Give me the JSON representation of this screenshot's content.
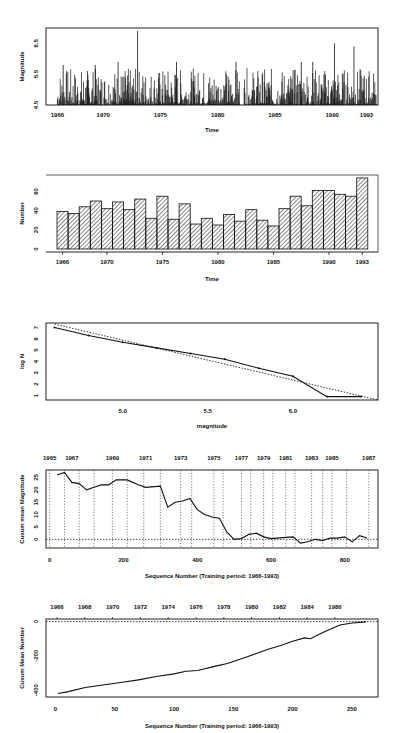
{
  "chart_data": [
    {
      "type": "bar",
      "subtype": "spike-time-series",
      "title": "",
      "xlabel": "Time",
      "ylabel": "Magnitude",
      "xticks": [
        "1966",
        "1970",
        "1975",
        "1980",
        "1985",
        "1990",
        "1993"
      ],
      "xtick_values": [
        1966,
        1970,
        1975,
        1980,
        1985,
        1990,
        1993
      ],
      "yticks": [
        "4.5",
        "5.5",
        "6.5"
      ],
      "ylim": [
        4.5,
        7.0
      ],
      "xlim": [
        1965.0,
        1994.0
      ],
      "description": "Dense vertical spikes per event, most between 4.5 and 5.5; largest spike ~6.9 near 1973",
      "notable_peaks": [
        {
          "x": 1966.5,
          "y": 5.8
        },
        {
          "x": 1969.3,
          "y": 5.8
        },
        {
          "x": 1971.3,
          "y": 5.9
        },
        {
          "x": 1973.0,
          "y": 6.9
        },
        {
          "x": 1976.4,
          "y": 5.9
        },
        {
          "x": 1981.6,
          "y": 5.9
        },
        {
          "x": 1987.3,
          "y": 5.9
        },
        {
          "x": 1988.3,
          "y": 5.9
        },
        {
          "x": 1990.2,
          "y": 6.5
        },
        {
          "x": 1991.9,
          "y": 6.4
        }
      ],
      "grid": false
    },
    {
      "type": "bar",
      "title": "",
      "xlabel": "Time",
      "ylabel": "Number",
      "categories": [
        "1966",
        "1967",
        "1968",
        "1969",
        "1970",
        "1971",
        "1972",
        "1973",
        "1974",
        "1975",
        "1976",
        "1977",
        "1978",
        "1979",
        "1980",
        "1981",
        "1982",
        "1983",
        "1984",
        "1985",
        "1986",
        "1987",
        "1988",
        "1989",
        "1990",
        "1991",
        "1992",
        "1993"
      ],
      "values": [
        39,
        37,
        44,
        50,
        42,
        49,
        41,
        52,
        32,
        55,
        31,
        47,
        26,
        32,
        25,
        36,
        29,
        41,
        30,
        24,
        42,
        55,
        45,
        61,
        61,
        57,
        55,
        74
      ],
      "xticks": [
        "1966",
        "1970",
        "1975",
        "1980",
        "1985",
        "1990",
        "1993"
      ],
      "yticks": [
        "0",
        "20",
        "40",
        "60"
      ],
      "ylim": [
        0,
        75
      ],
      "pattern": "diagonal-hatch",
      "grid": false
    },
    {
      "type": "line",
      "title": "",
      "xlabel": "magnitude",
      "ylabel": "log N",
      "xticks": [
        "5.0",
        "5.5",
        "6.0"
      ],
      "yticks": [
        "1",
        "2",
        "3",
        "4",
        "5",
        "6",
        "7"
      ],
      "xlim": [
        4.55,
        6.5
      ],
      "ylim": [
        0.6,
        7.4
      ],
      "series": [
        {
          "name": "observed",
          "style": "solid-with-markers",
          "x": [
            4.6,
            4.8,
            5.0,
            5.2,
            5.4,
            5.6,
            5.8,
            6.0,
            6.2,
            6.4
          ],
          "y": [
            7.0,
            6.3,
            5.7,
            5.2,
            4.7,
            4.2,
            3.4,
            2.7,
            0.9,
            0.9
          ]
        },
        {
          "name": "fit",
          "style": "dotted",
          "x": [
            4.6,
            6.5
          ],
          "y": [
            7.3,
            0.6
          ]
        }
      ],
      "grid": false
    },
    {
      "type": "line",
      "title": "",
      "xlabel": "Sequence Number (Training period: 1966-1993)",
      "ylabel": "Cusum mean Magnitude",
      "xticks": [
        "0",
        "200",
        "400",
        "600",
        "800"
      ],
      "yticks": [
        "0",
        "5",
        "10",
        "15",
        "20",
        "25"
      ],
      "top_axis_labels": [
        "1965",
        "1967",
        "1969",
        "1971",
        "1973",
        "1975",
        "1977",
        "1979",
        "1981",
        "1983",
        "1985",
        "1987"
      ],
      "xlim": [
        -10,
        890
      ],
      "ylim": [
        -3.5,
        28
      ],
      "reference_line": {
        "y": 0,
        "style": "dotted"
      },
      "vertical_year_lines": [
        0,
        40,
        80,
        120,
        170,
        210,
        255,
        300,
        355,
        385,
        445,
        470,
        520,
        545,
        580,
        605,
        640,
        665,
        710,
        740,
        765,
        805,
        865
      ],
      "series": [
        {
          "name": "cusum",
          "x": [
            20,
            40,
            60,
            80,
            100,
            120,
            140,
            160,
            180,
            210,
            240,
            260,
            300,
            320,
            340,
            360,
            380,
            400,
            420,
            440,
            460,
            480,
            500,
            520,
            540,
            560,
            580,
            600,
            640,
            660,
            680,
            700,
            720,
            740,
            760,
            780,
            800,
            810,
            820,
            840,
            860
          ],
          "y": [
            26,
            27,
            23,
            22.5,
            20,
            21,
            22,
            22,
            24,
            24,
            22,
            21,
            21.5,
            13,
            15,
            15.5,
            16.5,
            12,
            10,
            9,
            8.5,
            3,
            0,
            0.3,
            2,
            2.5,
            1,
            0.3,
            0.8,
            1,
            -1.5,
            -1,
            0,
            -0.5,
            0.5,
            0.5,
            1,
            0,
            -1,
            1.5,
            0.5
          ]
        }
      ],
      "grid": false
    },
    {
      "type": "line",
      "title": "",
      "xlabel": "Sequence Number (Training period: 1966-1993)",
      "ylabel": "Cusum Mean Number",
      "xticks": [
        "0",
        "50",
        "100",
        "150",
        "200",
        "250"
      ],
      "yticks": [
        "0",
        "-200",
        "-400"
      ],
      "top_axis_labels": [
        "1966",
        "1968",
        "1970",
        "1972",
        "1974",
        "1976",
        "1978",
        "1980",
        "1982",
        "1984",
        "1986"
      ],
      "xlim": [
        -8,
        272
      ],
      "ylim": [
        -440,
        15
      ],
      "reference_line": {
        "y": 0,
        "style": "dotted"
      },
      "series": [
        {
          "name": "cusum",
          "x": [
            2,
            10,
            25,
            40,
            55,
            70,
            85,
            100,
            110,
            120,
            135,
            145,
            160,
            170,
            180,
            190,
            200,
            210,
            215,
            225,
            235,
            240,
            250,
            262
          ],
          "y": [
            -420,
            -410,
            -385,
            -370,
            -355,
            -340,
            -320,
            -305,
            -290,
            -285,
            -260,
            -245,
            -210,
            -185,
            -160,
            -140,
            -115,
            -95,
            -100,
            -65,
            -35,
            -20,
            -8,
            -2
          ]
        }
      ],
      "grid": false
    }
  ]
}
